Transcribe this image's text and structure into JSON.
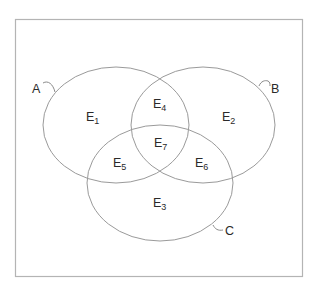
{
  "diagram": {
    "type": "venn",
    "sets": [
      {
        "name": "A",
        "label": "A"
      },
      {
        "name": "B",
        "label": "B"
      },
      {
        "name": "C",
        "label": "C"
      }
    ],
    "regions": [
      {
        "id": "E1",
        "base": "E",
        "sub": "1",
        "membership": "A only"
      },
      {
        "id": "E2",
        "base": "E",
        "sub": "2",
        "membership": "B only"
      },
      {
        "id": "E3",
        "base": "E",
        "sub": "3",
        "membership": "C only"
      },
      {
        "id": "E4",
        "base": "E",
        "sub": "4",
        "membership": "A and B"
      },
      {
        "id": "E5",
        "base": "E",
        "sub": "5",
        "membership": "A and C"
      },
      {
        "id": "E6",
        "base": "E",
        "sub": "6",
        "membership": "B and C"
      },
      {
        "id": "E7",
        "base": "E",
        "sub": "7",
        "membership": "A and B and C"
      }
    ],
    "colors": {
      "frame": "#b4b4b4",
      "outline": "#9a9a9a",
      "text": "#2a2a2a"
    }
  }
}
